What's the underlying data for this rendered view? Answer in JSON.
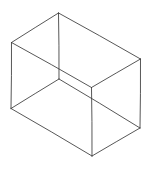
{
  "diagram": {
    "title": "",
    "type": "wireframe-cuboid-sketch",
    "stroke_color": "#3a3a3a",
    "background_color": "#ffffff",
    "vertices": {
      "top_back": [
        58.5,
        13
      ],
      "left_top": [
        11.5,
        42.5
      ],
      "right_top": [
        140.5,
        59
      ],
      "front_top": [
        91.5,
        87.5
      ],
      "left_bottom": [
        11,
        108.5
      ],
      "hidden_back_bottom": [
        59,
        79
      ],
      "front_bottom": [
        92,
        156
      ],
      "right_bottom": [
        140,
        128
      ]
    },
    "edges": [
      {
        "name": "top-left-edge",
        "from": "top_back",
        "to": "left_top"
      },
      {
        "name": "top-right-edge",
        "from": "top_back",
        "to": "right_top"
      },
      {
        "name": "top-front-left-edge",
        "from": "left_top",
        "to": "front_top"
      },
      {
        "name": "top-front-right-edge",
        "from": "front_top",
        "to": "right_top"
      },
      {
        "name": "left-vertical-edge",
        "from": "left_top",
        "to": "left_bottom"
      },
      {
        "name": "front-vertical-edge",
        "from": "front_top",
        "to": "front_bottom"
      },
      {
        "name": "right-vertical-edge",
        "from": "right_top",
        "to": "right_bottom"
      },
      {
        "name": "bottom-front-left-edge",
        "from": "left_bottom",
        "to": "front_bottom"
      },
      {
        "name": "bottom-front-right-edge",
        "from": "front_bottom",
        "to": "right_bottom"
      },
      {
        "name": "back-vertical-edge",
        "from": "top_back",
        "to": "hidden_back_bottom"
      },
      {
        "name": "bottom-back-left-edge",
        "from": "hidden_back_bottom",
        "to": "left_bottom"
      },
      {
        "name": "bottom-back-right-edge",
        "from": "hidden_back_bottom",
        "to": "right_bottom"
      }
    ]
  }
}
